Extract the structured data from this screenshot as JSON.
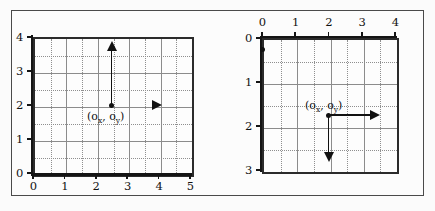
{
  "figure": {
    "background_color": "#fbfbfb",
    "frame_color": "#4a4a4a",
    "axis_color": "#141414",
    "grid_major_color": "#8c8c8c",
    "grid_minor_color": "#8f8f8f"
  },
  "panels": [
    {
      "id": "left-panel",
      "name": "cartesian-coordinate-panel",
      "description": "Standard math convention: y increases upward",
      "x_axis": {
        "position": "bottom",
        "min": 0,
        "max": 5,
        "tick_labels": [
          "0",
          "1",
          "2",
          "3",
          "4",
          "5"
        ],
        "tick_values": [
          0,
          1,
          2,
          3,
          4,
          5
        ],
        "minor_step": 0.5
      },
      "y_axis": {
        "position": "left",
        "min": 0,
        "max": 4,
        "direction": "up",
        "tick_labels": [
          "0",
          "1",
          "2",
          "3",
          "4"
        ],
        "tick_values": [
          0,
          1,
          2,
          3,
          4
        ],
        "minor_step": 0.5
      },
      "origin_point": {
        "label": "(o",
        "label_sub_x": "x",
        "label_mid": ", o",
        "label_sub_y": "y",
        "label_end": ")",
        "x": 2.5,
        "y": 2
      },
      "arrows": [
        {
          "name": "y-direction-arrow",
          "direction": "up",
          "from_x": 2.5,
          "from_y": 2,
          "to_x": 2.5,
          "to_y": 3.6
        },
        {
          "name": "x-direction-arrowhead",
          "direction": "right",
          "at_x": 4,
          "at_y": 2
        }
      ]
    },
    {
      "id": "right-panel",
      "name": "image-coordinate-panel",
      "description": "Image convention: y increases downward, origin at top-left",
      "x_axis": {
        "position": "top",
        "min": 0,
        "max": 4,
        "tick_labels": [
          "0",
          "1",
          "2",
          "3",
          "4"
        ],
        "tick_values": [
          0,
          1,
          2,
          3,
          4
        ],
        "minor_step": 0.5
      },
      "y_axis": {
        "position": "left",
        "min": 0,
        "max": 3,
        "direction": "down",
        "tick_labels": [
          "0",
          "1",
          "2",
          "3"
        ],
        "tick_values": [
          0,
          1,
          2,
          3
        ],
        "minor_step": 0.5
      },
      "corner_point": {
        "name": "image-origin-dot",
        "x": 0,
        "y": 0
      },
      "origin_point": {
        "label": "(o",
        "label_sub_x": "x",
        "label_mid": ", o",
        "label_sub_y": "y",
        "label_end": ")",
        "x": 2.5,
        "y": 2
      },
      "arrows": [
        {
          "name": "x-direction-arrow",
          "direction": "right",
          "from_x": 2.5,
          "from_y": 2,
          "to_x": 4.1,
          "to_y": 2
        },
        {
          "name": "y-direction-arrow",
          "direction": "down",
          "from_x": 2.5,
          "from_y": 2,
          "to_x": 2.5,
          "to_y": 3.3
        }
      ]
    }
  ]
}
